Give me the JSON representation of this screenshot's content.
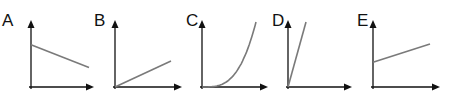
{
  "diagram": {
    "graphs": [
      {
        "label": "A",
        "shape": "straight line, decreasing, positive y-intercept",
        "points": [
          [
            0,
            0.65
          ],
          [
            1,
            0.3
          ]
        ]
      },
      {
        "label": "B",
        "shape": "straight line through origin, shallow positive slope",
        "points": [
          [
            0,
            0
          ],
          [
            1,
            0.4
          ]
        ]
      },
      {
        "label": "C",
        "shape": "curve through origin, increasing slope (exponential/quadratic)",
        "points": [
          [
            0,
            0
          ],
          [
            0.25,
            0.02
          ],
          [
            0.5,
            0.12
          ],
          [
            0.75,
            0.38
          ],
          [
            1,
            1
          ]
        ]
      },
      {
        "label": "D",
        "shape": "straight line through origin, steep positive slope",
        "points": [
          [
            0,
            0
          ],
          [
            0.3,
            1
          ]
        ]
      },
      {
        "label": "E",
        "shape": "straight line, increasing, positive y-intercept",
        "points": [
          [
            0,
            0.38
          ],
          [
            1,
            0.66
          ]
        ]
      }
    ]
  }
}
